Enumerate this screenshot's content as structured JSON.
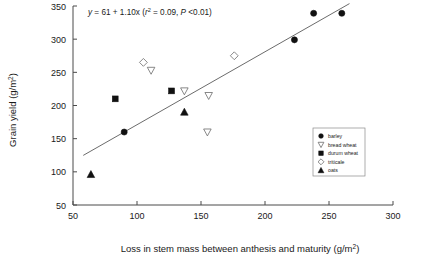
{
  "chart_data": {
    "type": "scatter",
    "title": "",
    "xlabel": "Loss in stem mass between anthesis and maturity (g/m²)",
    "ylabel": "Grain yield (g/m²)",
    "xlim": [
      50,
      300
    ],
    "ylim": [
      50,
      350
    ],
    "xticks": [
      "50",
      "100",
      "150",
      "200",
      "250",
      "300"
    ],
    "yticks": [
      "50",
      "100",
      "150",
      "200",
      "250",
      "300",
      "350"
    ],
    "grid": false,
    "annotation": "y = 61 + 1.10x (r² = 0.09, P <0.01)",
    "annotation_parts": {
      "y": "y",
      "eq": " = 61 + 1.10x (",
      "r": "r",
      "sup2": "2",
      "mid": " = 0.09, ",
      "p": "P",
      "tail": " <0.01)"
    },
    "fit_line": {
      "slope": 1.1,
      "intercept": 61,
      "x_start": 58,
      "x_end": 266,
      "y_start": 124.8,
      "y_end": 353.6
    },
    "legend_position": "bottom-right",
    "series": [
      {
        "name": "barley",
        "marker": "filled-circle",
        "points": [
          [
            90,
            160
          ],
          [
            223,
            299
          ],
          [
            238,
            339
          ],
          [
            260,
            339
          ]
        ]
      },
      {
        "name": "bread wheat",
        "marker": "open-triangle-down",
        "points": [
          [
            111,
            253
          ],
          [
            137,
            222
          ],
          [
            156,
            215
          ],
          [
            155,
            160
          ]
        ]
      },
      {
        "name": "durum wheat",
        "marker": "filled-square",
        "points": [
          [
            83,
            210
          ],
          [
            127,
            222
          ]
        ]
      },
      {
        "name": "triticale",
        "marker": "open-diamond",
        "points": [
          [
            105,
            265
          ],
          [
            176,
            275
          ]
        ]
      },
      {
        "name": "oats",
        "marker": "filled-triangle-up",
        "points": [
          [
            64,
            96
          ],
          [
            137,
            190
          ]
        ]
      }
    ]
  }
}
